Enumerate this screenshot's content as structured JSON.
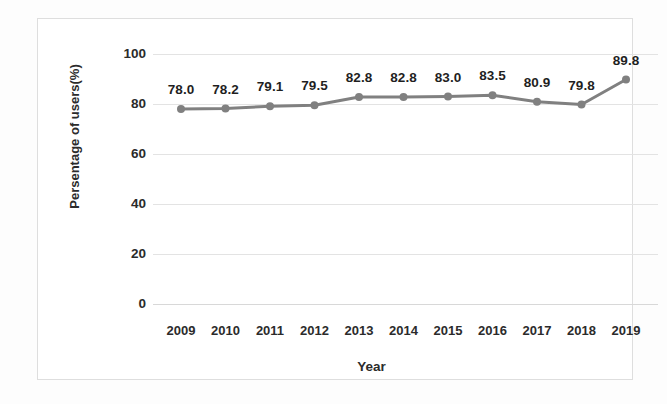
{
  "chart_data": {
    "type": "line",
    "title": "",
    "xlabel": "Year",
    "ylabel": "Persentage of users(%)",
    "categories": [
      "2009",
      "2010",
      "2011",
      "2012",
      "2013",
      "2014",
      "2015",
      "2016",
      "2017",
      "2018",
      "2019"
    ],
    "values": [
      78.0,
      78.2,
      79.1,
      79.5,
      82.8,
      82.8,
      83.0,
      83.5,
      80.9,
      79.8,
      89.8
    ],
    "point_labels": [
      "78.0",
      "78.2",
      "79.1",
      "79.5",
      "82.8",
      "82.8",
      "83.0",
      "83.5",
      "80.9",
      "79.8",
      "89.8"
    ],
    "ylim": [
      0,
      100
    ],
    "yticks": [
      0,
      20,
      40,
      60,
      80,
      100
    ],
    "ytick_labels": [
      "0",
      "20",
      "40",
      "60",
      "80",
      "100"
    ],
    "grid": true,
    "legend": "none",
    "series_color": "#808080",
    "marker": "circle",
    "data_labels_shown": true
  }
}
